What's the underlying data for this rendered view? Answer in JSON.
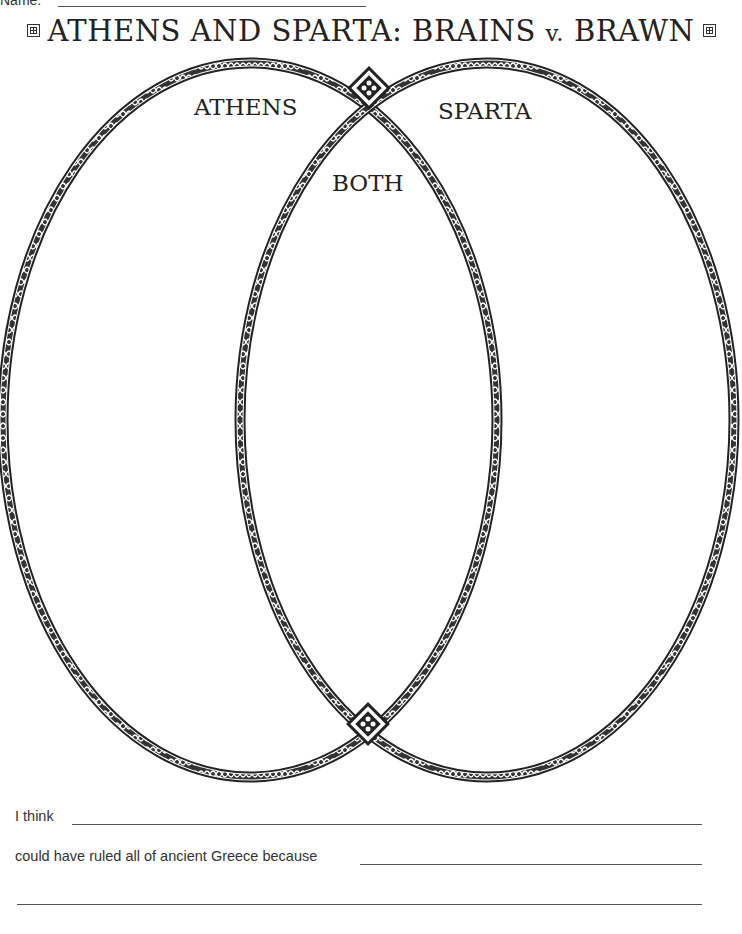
{
  "header": {
    "name_label": "Name:",
    "title_main": "ATHENS AND SPARTA: BRAINS ",
    "title_v": "v.",
    "title_end": " BRAWN"
  },
  "venn": {
    "left_label": "ATHENS",
    "right_label": "SPARTA",
    "overlap_label": "BOTH"
  },
  "footer": {
    "line1_prompt": "I think",
    "line2_prompt": "could have ruled all of ancient Greece because"
  }
}
